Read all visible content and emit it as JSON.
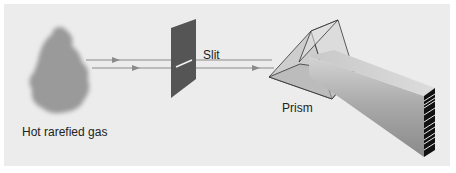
{
  "diagram": {
    "labels": {
      "gas": "Hot rarefied gas",
      "slit": "Slit",
      "prism": "Prism"
    },
    "colors": {
      "background": "#ececec",
      "gas_cloud": "#9a9a9a",
      "slit_plate": "#555555",
      "light_ray": "#8a8a8a",
      "spectrum_lines": "#111111"
    },
    "components": [
      "gas-cloud",
      "light-rays",
      "slit-plate",
      "prism",
      "dispersed-beam",
      "emission-spectrum"
    ]
  }
}
